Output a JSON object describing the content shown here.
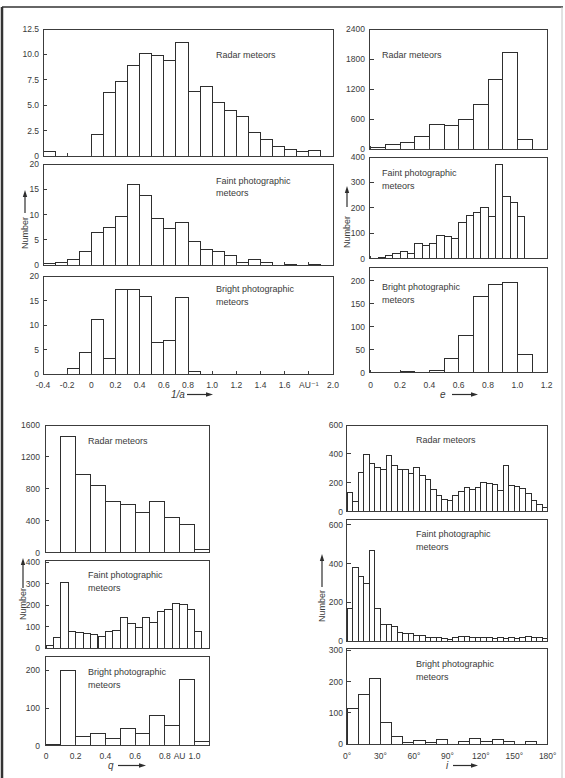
{
  "figure": {
    "y_axis_label": "Number"
  },
  "chart_data": [
    {
      "id": "inv_a",
      "type": "bar",
      "title": "",
      "xlabel": "1/a",
      "ylabel": "Number",
      "xlim": [
        -0.4,
        2.0
      ],
      "grid": false,
      "x_ticks": [
        {
          "value": -0.4,
          "label": "-0.4"
        },
        {
          "value": -0.2,
          "label": "-0.2"
        },
        {
          "value": 0,
          "label": "0"
        },
        {
          "value": 0.2,
          "label": "0.2"
        },
        {
          "value": 0.4,
          "label": "0.4"
        },
        {
          "value": 0.6,
          "label": "0.6"
        },
        {
          "value": 0.8,
          "label": "0.8"
        },
        {
          "value": 1.0,
          "label": "1.0"
        },
        {
          "value": 1.2,
          "label": "1.2"
        },
        {
          "value": 1.4,
          "label": "1.4"
        },
        {
          "value": 1.6,
          "label": "1.6"
        },
        {
          "value": 1.8,
          "label": "AU⁻¹"
        },
        {
          "value": 2.0,
          "label": "2.0"
        }
      ],
      "series": [
        {
          "key": "radar",
          "name": "Radar meteors",
          "label_lines": [
            "Radar meteors"
          ],
          "bin_start": -0.4,
          "bin_width": 0.1,
          "values": [
            0.4,
            0,
            0,
            0,
            2.1,
            6.3,
            7.3,
            8.9,
            10.1,
            9.9,
            9.4,
            11.2,
            6.4,
            6.8,
            5.3,
            4.5,
            3.9,
            2.3,
            1.6,
            0.9,
            0.6,
            0.4,
            0.5,
            0
          ],
          "ylim": [
            0,
            12.5
          ],
          "y_ticks": [
            0,
            2.5,
            5,
            7.5,
            10,
            12.5
          ],
          "y_tick_labels": [
            "0",
            "2.5",
            "5.0",
            "7.5",
            "10.0",
            "12.5"
          ]
        },
        {
          "key": "faint",
          "name": "Faint photographic meteors",
          "label_lines": [
            "Faint photographic",
            "meteors"
          ],
          "bin_start": -0.4,
          "bin_width": 0.1,
          "values": [
            0.3,
            0.6,
            1.0,
            2.7,
            6.5,
            7.5,
            9.6,
            16.0,
            13.8,
            9.3,
            7.3,
            8.4,
            4.7,
            3.1,
            2.6,
            1.8,
            0.6,
            1.0,
            0.5,
            0,
            0.2,
            0,
            0.2,
            0
          ],
          "ylim": [
            0,
            20
          ],
          "y_ticks": [
            0,
            5,
            10,
            15,
            20
          ],
          "y_tick_labels": [
            "0",
            "5",
            "10",
            "15",
            "20"
          ]
        },
        {
          "key": "bright",
          "name": "Bright photographic meteors",
          "label_lines": [
            "Bright photographic",
            "meteors"
          ],
          "bin_start": -0.4,
          "bin_width": 0.1,
          "values": [
            0,
            0,
            1.2,
            4.3,
            11.2,
            3.2,
            17.3,
            17.3,
            15.9,
            6.5,
            6.8,
            15.7,
            0.5,
            0,
            0,
            0,
            0,
            0,
            0,
            0,
            0,
            0,
            0,
            0
          ],
          "ylim": [
            0,
            20
          ],
          "y_ticks": [
            0,
            5,
            10,
            15,
            20
          ],
          "y_tick_labels": [
            "0",
            "5",
            "10",
            "15",
            "20"
          ]
        }
      ]
    },
    {
      "id": "e",
      "type": "bar",
      "title": "",
      "xlabel": "e",
      "ylabel": "Number",
      "xlim": [
        0,
        1.2
      ],
      "grid": false,
      "x_ticks": [
        {
          "value": 0,
          "label": "0"
        },
        {
          "value": 0.2,
          "label": "0.2"
        },
        {
          "value": 0.4,
          "label": "0.4"
        },
        {
          "value": 0.6,
          "label": "0.6"
        },
        {
          "value": 0.8,
          "label": "0.8"
        },
        {
          "value": 1.0,
          "label": "1.0"
        },
        {
          "value": 1.2,
          "label": "1.2"
        }
      ],
      "series": [
        {
          "key": "radar",
          "name": "Radar meteors",
          "label_lines": [
            "Radar meteors"
          ],
          "bin_start": 0,
          "bin_width": 0.1,
          "values": [
            40,
            100,
            133,
            253,
            500,
            467,
            587,
            900,
            1387,
            1940,
            200
          ],
          "ylim": [
            0,
            2400
          ],
          "y_ticks": [
            0,
            600,
            1200,
            1800,
            2400
          ],
          "y_tick_labels": [
            "0",
            "600",
            "1200",
            "1800",
            "2400"
          ]
        },
        {
          "key": "faint",
          "name": "Faint photographic meteors",
          "label_lines": [
            "Faint photographic",
            "meteors"
          ],
          "bin_start": 0.05,
          "bin_width": 0.05,
          "values": [
            5,
            14,
            22,
            30,
            21,
            60,
            52,
            60,
            92,
            88,
            81,
            144,
            171,
            180,
            201,
            165,
            369,
            246,
            220,
            165
          ],
          "ylim": [
            0,
            400
          ],
          "y_ticks": [
            0,
            100,
            200,
            300,
            400
          ],
          "y_tick_labels": [
            "0",
            "100",
            "200",
            "300",
            "400"
          ]
        },
        {
          "key": "bright",
          "name": "Bright photographic meteors",
          "label_lines": [
            "Bright photographic",
            "meteors"
          ],
          "bin_start": 0,
          "bin_width": 0.1,
          "values": [
            0,
            0,
            2,
            0,
            5,
            30,
            80,
            167,
            192,
            196,
            40
          ],
          "ylim": [
            0,
            230
          ],
          "y_ticks": [
            0,
            50,
            100,
            150,
            200
          ],
          "y_tick_labels": [
            "0",
            "50",
            "100",
            "150",
            "200"
          ]
        }
      ]
    },
    {
      "id": "q",
      "type": "bar",
      "title": "",
      "xlabel": "q",
      "ylabel": "Number",
      "xlim": [
        0,
        1.1
      ],
      "grid": false,
      "x_ticks": [
        {
          "value": 0,
          "label": "0"
        },
        {
          "value": 0.2,
          "label": "0.2"
        },
        {
          "value": 0.4,
          "label": "0.4"
        },
        {
          "value": 0.6,
          "label": "0.6"
        },
        {
          "value": 0.8,
          "label": "0.8"
        },
        {
          "value": 0.9,
          "label": "AU"
        },
        {
          "value": 1.0,
          "label": "1.0"
        }
      ],
      "series": [
        {
          "key": "radar",
          "name": "Radar meteors",
          "label_lines": [
            "Radar meteors"
          ],
          "bin_start": 0.1,
          "bin_width": 0.1,
          "values": [
            1462,
            982,
            848,
            643,
            606,
            505,
            643,
            443,
            359,
            46
          ],
          "ylim": [
            0,
            1600
          ],
          "y_ticks": [
            0,
            400,
            800,
            1200,
            1600
          ],
          "y_tick_labels": [
            "0",
            "400",
            "800",
            "1200",
            "1600"
          ]
        },
        {
          "key": "faint",
          "name": "Faint photographic meteors",
          "label_lines": [
            "Faint photographic",
            "meteors"
          ],
          "bin_start": 0,
          "bin_width": 0.05,
          "values": [
            11,
            52,
            306,
            77,
            73,
            68,
            64,
            56,
            79,
            82,
            144,
            114,
            97,
            145,
            120,
            170,
            180,
            209,
            205,
            182,
            77
          ],
          "ylim": [
            0,
            410
          ],
          "y_ticks": [
            0,
            100,
            200,
            300,
            400
          ],
          "y_tick_labels": [
            "0",
            "100",
            "200",
            "300",
            "400"
          ]
        },
        {
          "key": "bright",
          "name": "Bright photographic meteors",
          "label_lines": [
            "Bright photographic",
            "meteors"
          ],
          "bin_start": 0,
          "bin_width": 0.1,
          "values": [
            4,
            200,
            24,
            33,
            19,
            47,
            33,
            81,
            55,
            175,
            11
          ],
          "ylim": [
            0,
            236
          ],
          "y_ticks": [
            0,
            100,
            200
          ],
          "y_tick_labels": [
            "0",
            "100",
            "200"
          ]
        }
      ]
    },
    {
      "id": "i",
      "type": "bar",
      "title": "",
      "xlabel": "i",
      "ylabel": "Number",
      "xlim": [
        0,
        180
      ],
      "grid": false,
      "x_ticks": [
        {
          "value": 0,
          "label": "0°"
        },
        {
          "value": 30,
          "label": "30°"
        },
        {
          "value": 60,
          "label": "60°"
        },
        {
          "value": 90,
          "label": "90°"
        },
        {
          "value": 120,
          "label": "120°"
        },
        {
          "value": 150,
          "label": "150°"
        },
        {
          "value": 180,
          "label": "180°"
        }
      ],
      "series": [
        {
          "key": "radar",
          "name": "Radar meteors",
          "label_lines": [
            "Radar meteors"
          ],
          "bin_start": 0,
          "bin_width": 5,
          "values": [
            134,
            74,
            272,
            397,
            335,
            309,
            295,
            388,
            321,
            295,
            295,
            268,
            309,
            249,
            224,
            155,
            115,
            88,
            78,
            115,
            143,
            168,
            157,
            168,
            203,
            196,
            189,
            145,
            318,
            182,
            175,
            159,
            125,
            76,
            51,
            28
          ],
          "ylim": [
            0,
            600
          ],
          "y_ticks": [
            0,
            200,
            400,
            600
          ],
          "y_tick_labels": [
            "0",
            "200",
            "400",
            "600"
          ]
        },
        {
          "key": "faint",
          "name": "Faint photographic meteors",
          "label_lines": [
            "Faint photographic",
            "meteors"
          ],
          "bin_start": 0,
          "bin_width": 5,
          "values": [
            166,
            381,
            333,
            295,
            467,
            169,
            86,
            86,
            74,
            45,
            40,
            40,
            31,
            28,
            19,
            19,
            17,
            14,
            10,
            16,
            21,
            24,
            17,
            16,
            19,
            17,
            14,
            16,
            14,
            17,
            14,
            17,
            21,
            19,
            17,
            14
          ],
          "ylim": [
            0,
            627
          ],
          "y_ticks": [
            0,
            200,
            400,
            600
          ],
          "y_tick_labels": [
            "0",
            "200",
            "400",
            "600"
          ]
        },
        {
          "key": "bright",
          "name": "Bright photographic meteors",
          "label_lines": [
            "Bright photographic",
            "meteors"
          ],
          "bin_start": 0,
          "bin_width": 10,
          "values": [
            115,
            157,
            209,
            68,
            25,
            6,
            11,
            5,
            15,
            0,
            9,
            18,
            9,
            14,
            9,
            0,
            8,
            0
          ],
          "ylim": [
            0,
            306
          ],
          "y_ticks": [
            0,
            100,
            200,
            300
          ],
          "y_tick_labels": [
            "0",
            "100",
            "200",
            "300"
          ]
        }
      ]
    }
  ]
}
